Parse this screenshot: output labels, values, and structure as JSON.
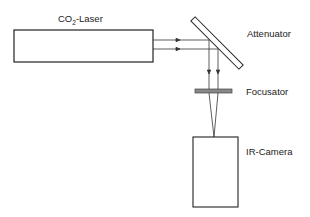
{
  "diagram": {
    "labels": {
      "laser_main": "CO",
      "laser_sub": "2",
      "laser_rest": "-Laser",
      "attenuator": "Attenuator",
      "focusator": "Focusator",
      "camera": "IR-Camera"
    },
    "components": [
      {
        "id": "co2-laser",
        "type": "box"
      },
      {
        "id": "attenuator",
        "type": "tilted-plate"
      },
      {
        "id": "focusator",
        "type": "lens-plate"
      },
      {
        "id": "ir-camera",
        "type": "box"
      }
    ],
    "colors": {
      "stroke": "#222222",
      "focusator_fill": "#888888",
      "background": "#ffffff"
    }
  }
}
